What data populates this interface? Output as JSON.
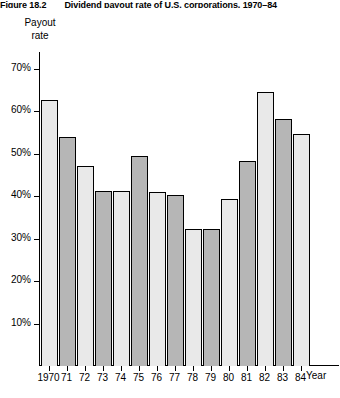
{
  "figure": {
    "number": "Figure 18.2",
    "title": "Dividend payout rate of U.S. corporations, 1970–84"
  },
  "axes": {
    "ylabel_line1": "Payout",
    "ylabel_line2": "rate",
    "xlabel": "Year",
    "yticks": [
      "10%",
      "20%",
      "30%",
      "40%",
      "50%",
      "60%",
      "70%"
    ]
  },
  "chart_data": {
    "type": "bar",
    "title": "Dividend payout rate of U.S. corporations, 1970–84",
    "xlabel": "Year",
    "ylabel": "Payout rate",
    "ylim": [
      0,
      74
    ],
    "ytick_values": [
      10,
      20,
      30,
      40,
      50,
      60,
      70
    ],
    "ytick_labels": [
      "10%",
      "20%",
      "30%",
      "40%",
      "50%",
      "60%",
      "70%"
    ],
    "grid": false,
    "legend": "none",
    "unit": "percent",
    "categories": [
      "1970",
      "71",
      "72",
      "73",
      "74",
      "75",
      "76",
      "77",
      "78",
      "79",
      "80",
      "81",
      "82",
      "83",
      "84"
    ],
    "values": [
      62.8,
      54.0,
      47.2,
      41.2,
      41.2,
      49.5,
      41.0,
      40.4,
      32.3,
      32.3,
      39.3,
      48.3,
      64.6,
      58.2,
      54.6
    ],
    "bar_styles": [
      "light",
      "dark",
      "light",
      "dark",
      "light",
      "dark",
      "light",
      "dark",
      "light",
      "dark",
      "light",
      "dark",
      "light",
      "dark",
      "light"
    ],
    "colors": {
      "bar_light": "#e9e9e9",
      "bar_dark": "#b6b6b6",
      "bar_outline": "#000000",
      "axis": "#000000",
      "background": "#ffffff"
    }
  }
}
